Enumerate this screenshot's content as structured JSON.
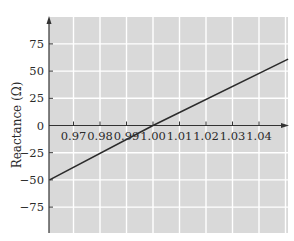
{
  "chart_data": {
    "type": "line",
    "title": "",
    "xlabel": "",
    "ylabel": "Reactance (Ω)",
    "xlim": [
      0.961,
      1.051
    ],
    "ylim": [
      -96,
      100
    ],
    "x_ticks": [
      0.97,
      0.98,
      0.99,
      1.0,
      1.01,
      1.02,
      1.03,
      1.04
    ],
    "x_tick_labels": [
      "0.97",
      "0.98",
      "0.99",
      "1.00",
      "1.01",
      "1.02",
      "1.03",
      "1.04"
    ],
    "y_ticks": [
      75,
      50,
      25,
      0,
      -25,
      -50,
      -75
    ],
    "y_tick_labels": [
      "75",
      "50",
      "25",
      "0",
      "−25",
      "−50",
      "−75"
    ],
    "grid": true,
    "legend": null,
    "series": [
      {
        "name": "Reactance",
        "x": [
          0.961,
          1.0,
          1.051
        ],
        "y": [
          -50,
          0,
          61
        ],
        "color": "#2b2b2b"
      }
    ],
    "colors": {
      "plot_background": "#d9d9d9",
      "grid": "#ffffff",
      "axis": "#333333",
      "line": "#2b2b2b"
    }
  }
}
